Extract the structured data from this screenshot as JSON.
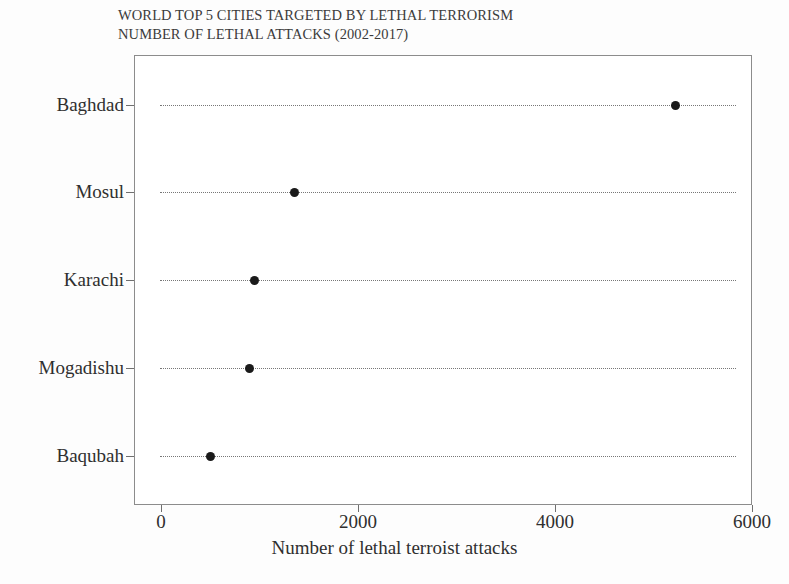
{
  "chart_data": {
    "type": "scatter",
    "title": "WORLD TOP 5 CITIES TARGETED BY LETHAL TERRORISM",
    "subtitle": "NUMBER OF LETHAL ATTACKS (2002-2017)",
    "orientation": "horizontal",
    "categories": [
      "Baghdad",
      "Mosul",
      "Karachi",
      "Mogadishu",
      "Baqubah"
    ],
    "values": [
      5220,
      1360,
      950,
      900,
      500
    ],
    "xlabel": "Number of lethal terroist attacks",
    "ylabel": "",
    "xlim": [
      0,
      6000
    ],
    "xticks": [
      0,
      2000,
      4000,
      6000
    ],
    "xtick_labels": [
      "0",
      "2000",
      "4000",
      "6000"
    ],
    "grid": "horizontal-dotted",
    "legend": "none",
    "marker": "filled-circle",
    "marker_color": "#1a1a1a",
    "frame_color": "#8c8c8c",
    "grid_color": "#777777"
  },
  "title": {
    "line1": "WORLD TOP 5 CITIES TARGETED BY LETHAL TERRORISM",
    "line2": "NUMBER OF LETHAL ATTACKS (2002-2017)"
  },
  "axes": {
    "x": {
      "label": "Number of lethal terroist attacks",
      "ticks": [
        {
          "label": "0",
          "value": 0
        },
        {
          "label": "2000",
          "value": 2000
        },
        {
          "label": "4000",
          "value": 4000
        },
        {
          "label": "6000",
          "value": 6000
        }
      ]
    },
    "y": {
      "ticks": [
        {
          "label": "Baghdad"
        },
        {
          "label": "Mosul"
        },
        {
          "label": "Karachi"
        },
        {
          "label": "Mogadishu"
        },
        {
          "label": "Baqubah"
        }
      ]
    }
  },
  "points": [
    {
      "category": "Baghdad",
      "value": 5220
    },
    {
      "category": "Mosul",
      "value": 1360
    },
    {
      "category": "Karachi",
      "value": 950
    },
    {
      "category": "Mogadishu",
      "value": 900
    },
    {
      "category": "Baqubah",
      "value": 500
    }
  ]
}
